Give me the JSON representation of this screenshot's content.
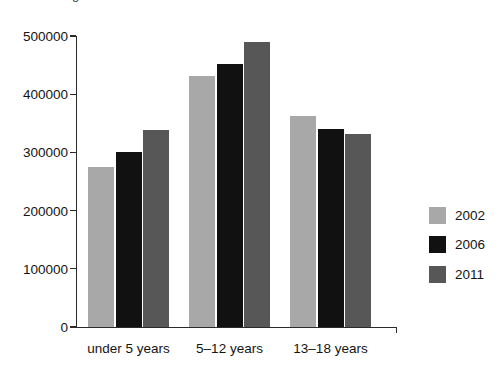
{
  "caption_clipped": "g",
  "chart_data": {
    "type": "bar",
    "title": "",
    "xlabel": "",
    "ylabel": "",
    "categories": [
      "under 5 years",
      "5–12 years",
      "13–18 years"
    ],
    "series": [
      {
        "name": "2002",
        "color": "#a8a8a8",
        "values": [
          275000,
          432000,
          362000
        ]
      },
      {
        "name": "2006",
        "color": "#111111",
        "values": [
          300000,
          452000,
          341000
        ]
      },
      {
        "name": "2011",
        "color": "#575757",
        "values": [
          338000,
          489000,
          331000
        ]
      }
    ],
    "ylim": [
      0,
      500000
    ],
    "ytick_labels": [
      "0",
      "100000",
      "200000",
      "300000",
      "400000",
      "500000"
    ],
    "ytick_values": [
      0,
      100000,
      200000,
      300000,
      400000,
      500000
    ],
    "grid": false,
    "legend_position": "right",
    "legend_entries": [
      "2002",
      "2006",
      "2011"
    ]
  },
  "axis": {
    "y_line_color": "#2b2b2b",
    "x_line_color": "#2b2b2b"
  },
  "background": "#ffffff"
}
